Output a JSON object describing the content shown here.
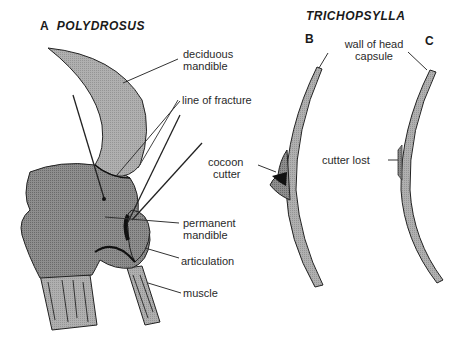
{
  "panel_a": {
    "letter": "A",
    "genus": "POLYDROSUS",
    "labels": {
      "deciduous": "deciduous",
      "mandible1": "mandible",
      "fracture": "line of fracture",
      "permanent": "permanent",
      "mandible2": "mandible",
      "articulation": "articulation",
      "muscle": "muscle"
    }
  },
  "trichopsylla": {
    "genus": "TRICHOPSYLLA",
    "panel_b": {
      "letter": "B",
      "cocoon": "cocoon",
      "cutter": "cutter"
    },
    "panel_c": {
      "letter": "C",
      "cutter_lost": "cutter lost"
    },
    "wall_label_1": "wall of head",
    "wall_label_2": "capsule"
  },
  "colors": {
    "fill_light": "#a9a9a9",
    "fill_dark": "#7a7a7a",
    "line": "#222222",
    "text": "#2a2a2a"
  }
}
